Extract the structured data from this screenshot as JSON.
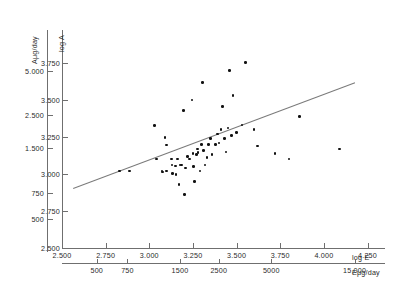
{
  "chart_data": {
    "type": "scatter",
    "title": "",
    "xlabel": "log E",
    "ylabel": "log A",
    "secondary_xlabel": "Eμg/day",
    "secondary_ylabel": "Aμg/day",
    "grid": false,
    "legend": "none",
    "xlim": [
      2.5,
      4.35
    ],
    "ylim": [
      2.5,
      3.79
    ],
    "x_ticks": [
      "2.500",
      "2.750",
      "3.000",
      "3.250",
      "3.500",
      "3.750",
      "4.000",
      "4.250"
    ],
    "x_tick_values": [
      2.5,
      2.75,
      3.0,
      3.25,
      3.5,
      3.75,
      4.0,
      4.25
    ],
    "y_ticks": [
      "2.500",
      "2.750",
      "3.000",
      "3.250",
      "3.500",
      "3.750"
    ],
    "y_tick_values": [
      2.5,
      2.75,
      3.0,
      3.25,
      3.5,
      3.75
    ],
    "secondary_x_ticks": [
      "500",
      "750",
      "1500",
      "2500",
      "5000",
      "15,000"
    ],
    "secondary_x_tick_values": [
      2.699,
      2.875,
      3.176,
      3.398,
      3.699,
      4.176
    ],
    "secondary_y_ticks": [
      "5.000",
      "2.500",
      "1.500",
      "750",
      "500"
    ],
    "secondary_y_tick_values": [
      3.699,
      3.398,
      3.176,
      2.875,
      2.699
    ],
    "points": [
      [
        2.829,
        3.02
      ],
      [
        2.888,
        3.02
      ],
      [
        3.03,
        3.327
      ],
      [
        3.041,
        3.1
      ],
      [
        3.072,
        3.02
      ],
      [
        3.076,
        3.013
      ],
      [
        3.09,
        3.246
      ],
      [
        3.1,
        3.196
      ],
      [
        3.1,
        3.02
      ],
      [
        3.126,
        3.1
      ],
      [
        3.13,
        3.06
      ],
      [
        3.134,
        3.003
      ],
      [
        3.15,
        3.055
      ],
      [
        3.153,
        2.996
      ],
      [
        3.16,
        3.1
      ],
      [
        3.17,
        2.93
      ],
      [
        3.175,
        3.06
      ],
      [
        3.183,
        3.06
      ],
      [
        3.195,
        3.43
      ],
      [
        3.2,
        2.86
      ],
      [
        3.207,
        3.04
      ],
      [
        3.22,
        3.12
      ],
      [
        3.23,
        3.1
      ],
      [
        3.245,
        3.5
      ],
      [
        3.25,
        3.14
      ],
      [
        3.253,
        3.05
      ],
      [
        3.26,
        2.95
      ],
      [
        3.27,
        3.13
      ],
      [
        3.276,
        3.17
      ],
      [
        3.28,
        3.145
      ],
      [
        3.29,
        3.02
      ],
      [
        3.3,
        3.2
      ],
      [
        3.305,
        3.62
      ],
      [
        3.31,
        3.16
      ],
      [
        3.32,
        3.06
      ],
      [
        3.33,
        3.11
      ],
      [
        3.34,
        3.2
      ],
      [
        3.35,
        3.24
      ],
      [
        3.36,
        3.13
      ],
      [
        3.38,
        3.2
      ],
      [
        3.39,
        3.27
      ],
      [
        3.4,
        3.21
      ],
      [
        3.41,
        3.3
      ],
      [
        3.42,
        3.455
      ],
      [
        3.43,
        3.24
      ],
      [
        3.44,
        3.15
      ],
      [
        3.45,
        3.31
      ],
      [
        3.46,
        3.7
      ],
      [
        3.47,
        3.26
      ],
      [
        3.48,
        3.53
      ],
      [
        3.5,
        3.28
      ],
      [
        3.53,
        3.33
      ],
      [
        3.55,
        3.755
      ],
      [
        3.6,
        3.3
      ],
      [
        3.62,
        3.19
      ],
      [
        3.72,
        3.14
      ],
      [
        3.8,
        3.1
      ],
      [
        3.86,
        3.39
      ],
      [
        4.09,
        3.17
      ]
    ],
    "regression_line": {
      "x0": 2.565,
      "y0": 2.905,
      "x1": 4.18,
      "y1": 3.62
    }
  }
}
